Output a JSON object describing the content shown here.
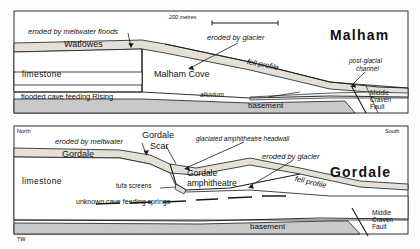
{
  "figure": {
    "title_credit": "TW",
    "scale_bar": {
      "label": "200 metres"
    }
  },
  "panels": [
    {
      "id": "malham",
      "region_name": "Malham",
      "orientation_left": "",
      "orientation_right": "",
      "labels": {
        "surface_feature": "Watlowes",
        "bedrock": "limestone",
        "cave": "flooded cave feeding Rising",
        "landform": "Malham Cove",
        "alluvium": "alluvium",
        "basement": "basement",
        "fault": "Middle Craven Fault",
        "fault_line1": "Middle",
        "fault_line2": "Craven",
        "fault_line3": "Fault"
      },
      "annotations": [
        {
          "text": "eroded by meltwater floods"
        },
        {
          "text": "eroded by glacier"
        },
        {
          "text": "fell profile"
        },
        {
          "text": "post-glacial"
        },
        {
          "text": "channel"
        }
      ]
    },
    {
      "id": "gordale",
      "region_name": "Gordale",
      "orientation_left": "North",
      "orientation_right": "South",
      "labels": {
        "surface_feature": "Gordale",
        "bedrock": "limestone",
        "cave": "unknown cave feeding springs",
        "landform_line1": "Gordale",
        "landform_line2": "amphitheatre",
        "scar_line1": "Gordale",
        "scar_line2": "Scar",
        "tufa": "tufa screens",
        "basement": "basement",
        "fault_line1": "Middle",
        "fault_line2": "Craven",
        "fault_line3": "Fault"
      },
      "annotations": [
        {
          "text": "eroded by meltwater"
        },
        {
          "text": "glaciated amphitheatre headwall"
        },
        {
          "text": "eroded by glacier"
        },
        {
          "text": "fell profile"
        }
      ]
    }
  ],
  "colors": {
    "stroke": "#1a1a1a",
    "drift_fill": "#e4e0d8",
    "limestone_fill": "#ffffff",
    "basement_fill": "#c9c9c9",
    "alluvium_fill": "#f2f2ef",
    "page": "#ffffff"
  }
}
